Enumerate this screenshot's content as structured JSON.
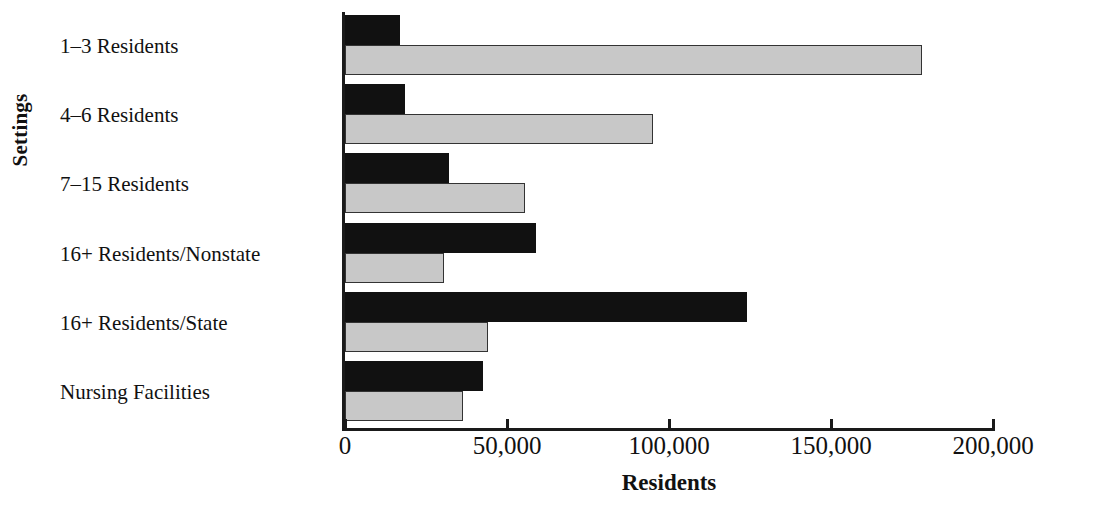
{
  "chart_data": {
    "type": "bar",
    "orientation": "horizontal",
    "title": "",
    "xlabel": "Residents",
    "ylabel": "Settings",
    "xlim": [
      0,
      200000
    ],
    "xticks": [
      0,
      50000,
      100000,
      150000,
      200000
    ],
    "xtick_labels": [
      "0",
      "50,000",
      "100,000",
      "150,000",
      "200,000"
    ],
    "grid": false,
    "legend": "none",
    "categories": [
      "1–3 Residents",
      "4–6 Residents",
      "7–15 Residents",
      "16+ Residents/Nonstate",
      "16+ Residents/State",
      "Nursing Facilities"
    ],
    "series": [
      {
        "name": "series-dark",
        "color": "#111111",
        "values": [
          17000,
          18500,
          32000,
          59000,
          124000,
          42500
        ]
      },
      {
        "name": "series-light",
        "color": "#c8c8c8",
        "values": [
          178000,
          95000,
          55500,
          30500,
          44000,
          36500
        ]
      }
    ]
  },
  "axes": {
    "y_title": "Settings",
    "x_title": "Residents"
  },
  "colors": {
    "dark_bar": "#111111",
    "light_bar": "#c8c8c8",
    "axis": "#1a1a1a",
    "background": "#ffffff"
  }
}
